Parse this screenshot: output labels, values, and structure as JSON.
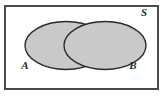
{
  "figure": {
    "kind": "venn-diagram",
    "title": "",
    "universe": {
      "label": "S",
      "label_name": "universal-set-label",
      "border_color": "#4a4a4a",
      "fill_color": "#ffffff"
    },
    "sets": [
      {
        "id": "A",
        "label": "A",
        "label_name": "set-a-label",
        "cx": 66,
        "cy": 45.5,
        "rx": 41,
        "ry": 24,
        "fill_color": "#c9c9c9",
        "stroke_color": "#2a2a2a",
        "label_x": 25,
        "label_y": 69
      },
      {
        "id": "B",
        "label": "B",
        "label_name": "set-b-label",
        "cx": 105,
        "cy": 45.5,
        "rx": 41,
        "ry": 24,
        "fill_color": "#c9c9c9",
        "stroke_color": "#2a2a2a",
        "label_x": 133,
        "label_y": 69
      }
    ],
    "universe_label_x": 144,
    "universe_label_y": 16,
    "rect": {
      "x": 5,
      "y": 6,
      "width": 153,
      "height": 83
    },
    "shading": {
      "region": "A union B",
      "color": "#c9c9c9",
      "intersection_shaded": true
    },
    "background_color": "#ffffff"
  }
}
